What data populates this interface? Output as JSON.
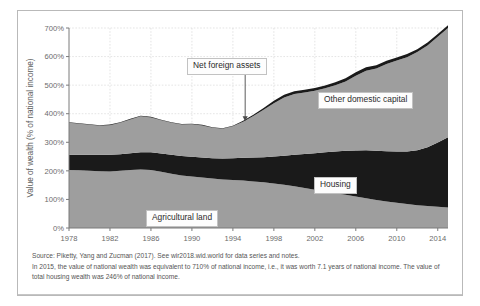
{
  "figure": {
    "notes": [
      "Source: Piketty, Yang and Zucman (2017). See wir2018.wid.world for data series and notes.",
      "In 2015, the value of national wealth was equivalent to 710% of national income, i.e., it was worth 7.1 years of national income. The value of total housing wealth was 246% of national income."
    ]
  },
  "callouts": {
    "net_foreign_assets": "Net foreign assets",
    "other_domestic_capital": "Other domestic capital",
    "housing": "Housing",
    "agricultural_land": "Agricultural land"
  },
  "colors": {
    "agricultural_land": "#9e9e9e",
    "housing": "#1a1a1a",
    "other_domestic_capital": "#9e9e9e",
    "net_foreign_assets": "#1a1a1a",
    "grid": "#d8d8d8",
    "axis": "#7a7a7a",
    "frame": "#b9b9b9"
  },
  "chart_data": {
    "type": "area",
    "stacked": true,
    "title": "",
    "xlabel": "",
    "ylabel": "Value of wealth (% of national income)",
    "xlim": [
      1978,
      2015
    ],
    "ylim": [
      0,
      700
    ],
    "ytick_labels": [
      "0%",
      "100%",
      "200%",
      "300%",
      "400%",
      "500%",
      "600%",
      "700%"
    ],
    "ytick_values": [
      0,
      100,
      200,
      300,
      400,
      500,
      600,
      700
    ],
    "xtick_labels": [
      "1978",
      "1982",
      "1986",
      "1990",
      "1994",
      "1998",
      "2002",
      "2006",
      "2010",
      "2014"
    ],
    "xtick_values": [
      1978,
      1982,
      1986,
      1990,
      1994,
      1998,
      2002,
      2006,
      2010,
      2014
    ],
    "grid": true,
    "legend_position": "inline-callouts",
    "x": [
      1978,
      1979,
      1980,
      1981,
      1982,
      1983,
      1984,
      1985,
      1986,
      1987,
      1988,
      1989,
      1990,
      1991,
      1992,
      1993,
      1994,
      1995,
      1996,
      1997,
      1998,
      1999,
      2000,
      2001,
      2002,
      2003,
      2004,
      2005,
      2006,
      2007,
      2008,
      2009,
      2010,
      2011,
      2012,
      2013,
      2014,
      2015
    ],
    "series": [
      {
        "name": "Agricultural land",
        "color": "#9e9e9e",
        "values": [
          203,
          202,
          200,
          199,
          198,
          200,
          203,
          205,
          203,
          197,
          190,
          184,
          180,
          177,
          173,
          170,
          168,
          166,
          163,
          160,
          156,
          151,
          146,
          140,
          134,
          128,
          122,
          116,
          110,
          104,
          98,
          93,
          88,
          84,
          80,
          77,
          74,
          72
        ]
      },
      {
        "name": "Housing",
        "color": "#1a1a1a",
        "values": [
          53,
          54,
          56,
          57,
          58,
          58,
          59,
          60,
          62,
          64,
          66,
          68,
          69,
          70,
          71,
          73,
          76,
          80,
          84,
          88,
          94,
          102,
          110,
          119,
          128,
          137,
          146,
          154,
          161,
          168,
          172,
          176,
          180,
          184,
          192,
          206,
          225,
          246
        ]
      },
      {
        "name": "Other domestic capital",
        "color": "#9e9e9e",
        "values": [
          112,
          109,
          105,
          102,
          104,
          110,
          118,
          126,
          122,
          116,
          112,
          110,
          114,
          112,
          107,
          104,
          112,
          126,
          145,
          166,
          187,
          204,
          213,
          215,
          218,
          224,
          232,
          243,
          262,
          278,
          288,
          305,
          318,
          330,
          344,
          356,
          370,
          382
        ]
      },
      {
        "name": "Net foreign assets",
        "color": "#1a1a1a",
        "values": [
          2,
          2,
          2,
          2,
          2,
          2,
          2,
          2,
          2,
          2,
          2,
          2,
          2,
          2,
          2,
          2,
          2,
          3,
          4,
          6,
          8,
          9,
          10,
          10,
          10,
          10,
          10,
          11,
          12,
          13,
          12,
          11,
          11,
          11,
          10,
          10,
          10,
          10
        ]
      }
    ],
    "total": [
      370,
      367,
      363,
      360,
      362,
      370,
      382,
      393,
      389,
      379,
      370,
      364,
      365,
      361,
      353,
      349,
      358,
      375,
      396,
      420,
      445,
      466,
      479,
      484,
      490,
      499,
      510,
      524,
      545,
      563,
      570,
      585,
      597,
      609,
      626,
      649,
      679,
      710
    ]
  }
}
